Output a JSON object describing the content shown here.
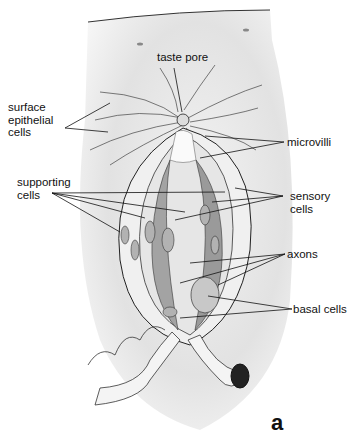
{
  "diagram": {
    "panel_label": "a",
    "labels": {
      "taste_pore": "taste pore",
      "surface_epithelial_cells": "surface\nepithelial\ncells",
      "microvilli": "microvilli",
      "supporting_cells": "supporting\ncells",
      "sensory_cells": "sensory\ncells",
      "axons": "axons",
      "basal_cells": "basal cells"
    },
    "colors": {
      "background_tissue": "#e4e4e4",
      "taste_bud_light": "#efefef",
      "sensory_cell": "#9a9a9a",
      "nucleus": "#b0b0b0",
      "outline": "#222222"
    }
  }
}
